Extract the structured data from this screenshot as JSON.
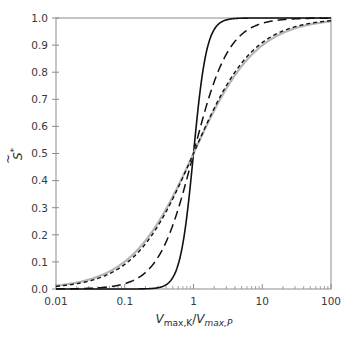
{
  "chart_data": {
    "type": "line",
    "title": "",
    "xlabel": "V_max,K / V_max,P",
    "xlabel_parts": {
      "main1": "V",
      "sub1": "max,K",
      "slash": "/",
      "main2": "V",
      "sub2": "max,P"
    },
    "ylabel": "S̃*",
    "ylabel_parts": {
      "main": "S",
      "sup": "*",
      "accent": "~"
    },
    "x_scale": "log",
    "xlim": [
      0.01,
      100
    ],
    "ylim": [
      0.0,
      1.0
    ],
    "x_ticks": [
      0.01,
      0.1,
      1,
      10,
      100
    ],
    "x_tick_labels": [
      "0.01",
      "0.1",
      "1",
      "10",
      "100"
    ],
    "y_ticks": [
      0.0,
      0.1,
      0.2,
      0.3,
      0.4,
      0.5,
      0.6,
      0.7,
      0.8,
      0.9,
      1.0
    ],
    "y_tick_labels": [
      "0.0",
      "0.1",
      "0.2",
      "0.3",
      "0.4",
      "0.5",
      "0.6",
      "0.7",
      "0.8",
      "0.9",
      "1.0"
    ],
    "grid": false,
    "legend": null,
    "x": [
      0.01,
      0.02,
      0.05,
      0.1,
      0.2,
      0.5,
      1,
      2,
      5,
      10,
      20,
      50,
      100
    ],
    "series": [
      {
        "name": "solid black (steep)",
        "hill_n": 4.5,
        "color": "#111111",
        "width": 1.6,
        "dash": "",
        "values": [
          0.0,
          0.0,
          0.0,
          0.0,
          0.0007,
          0.0423,
          0.5,
          0.9577,
          0.9993,
          1.0,
          1.0,
          1.0,
          1.0
        ]
      },
      {
        "name": "long-dashed black",
        "hill_n": 1.7,
        "color": "#111111",
        "width": 1.5,
        "dash": "9,5",
        "values": [
          0.0004,
          0.0013,
          0.0061,
          0.0196,
          0.0608,
          0.2353,
          0.5,
          0.7647,
          0.9392,
          0.9804,
          0.9939,
          0.9987,
          0.9996
        ]
      },
      {
        "name": "solid grey",
        "hill_n": 0.95,
        "color": "#b5b5b5",
        "width": 2.2,
        "dash": "",
        "values": [
          0.0124,
          0.0238,
          0.055,
          0.1009,
          0.1781,
          0.3411,
          0.5,
          0.6589,
          0.8219,
          0.8991,
          0.9465,
          0.9752,
          0.9876
        ]
      },
      {
        "name": "short-dashed black",
        "hill_n": 1.0,
        "color": "#111111",
        "width": 1.4,
        "dash": "4,3",
        "values": [
          0.0099,
          0.0196,
          0.0476,
          0.0909,
          0.1667,
          0.3333,
          0.5,
          0.6667,
          0.8333,
          0.9091,
          0.9524,
          0.9804,
          0.9901
        ]
      }
    ],
    "annotations": [
      {
        "text": "all curves intersect",
        "x": 1,
        "y": 0.5
      }
    ]
  },
  "layout_colors": {
    "axis": "#8c8c8c",
    "text": "#3a3a3a"
  }
}
